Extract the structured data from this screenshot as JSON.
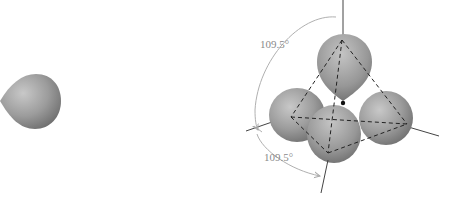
{
  "figure": {
    "left_panel": {
      "orbital": "single sp3 hybrid orbital lobe",
      "icon": "orbital-lobe-icon"
    },
    "right_panel": {
      "orbital": "four sp3 hybrid orbitals in tetrahedral arrangement",
      "angle_labels": [
        "109.5°",
        "109.5°"
      ]
    },
    "colors": {
      "lobe_light": "#c4c4c4",
      "lobe_mid": "#9a9a9a",
      "lobe_dark": "#6e6e6e",
      "axis": "#444444",
      "arrow": "#b0b0b0",
      "label": "#8a8a8a",
      "dash": "#222222"
    }
  }
}
